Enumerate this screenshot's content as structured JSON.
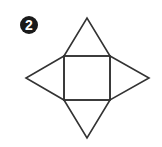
{
  "figure": {
    "label": "2",
    "stroke_color": "#333333",
    "badge_color": "#1a1a1a",
    "square": {
      "x": 64,
      "y": 56,
      "width": 46,
      "height": 44
    },
    "triangles": {
      "top": {
        "apex": [
          87,
          18
        ]
      },
      "left": {
        "apex": [
          26,
          78
        ]
      },
      "right": {
        "apex": [
          149,
          78
        ]
      },
      "bottom": {
        "apex": [
          87,
          138
        ]
      }
    }
  }
}
